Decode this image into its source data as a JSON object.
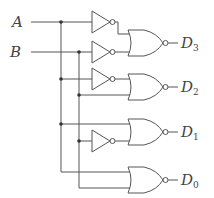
{
  "diagram": {
    "inputs": [
      {
        "label": "A"
      },
      {
        "label": "B"
      }
    ],
    "outputs": [
      {
        "label": "D",
        "subscript": "3"
      },
      {
        "label": "D",
        "subscript": "2"
      },
      {
        "label": "D",
        "subscript": "1"
      },
      {
        "label": "D",
        "subscript": "0"
      }
    ],
    "gates": [
      {
        "type": "NOT",
        "input": "A"
      },
      {
        "type": "NOT",
        "input": "B"
      },
      {
        "type": "NOR",
        "inputs": [
          "A'",
          "B'"
        ],
        "output": "D3"
      },
      {
        "type": "NOT",
        "input": "A"
      },
      {
        "type": "NOR",
        "inputs": [
          "A'",
          "B"
        ],
        "output": "D2"
      },
      {
        "type": "NOT",
        "input": "B"
      },
      {
        "type": "NOR",
        "inputs": [
          "A",
          "B'"
        ],
        "output": "D1"
      },
      {
        "type": "NOR",
        "inputs": [
          "A",
          "B"
        ],
        "output": "D0"
      }
    ],
    "colors": {
      "line": "#555555",
      "background": "#ffffff"
    }
  }
}
